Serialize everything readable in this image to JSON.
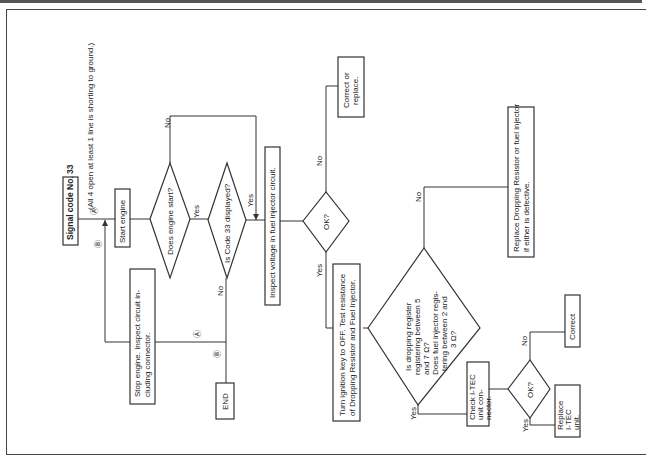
{
  "diagram": {
    "title": "Signal code No. 33",
    "subtitle": "(All 4 open at least 1 line is shorting to ground.)",
    "orientation": "rotated 90° counter-clockwise",
    "nodes": {
      "start_engine": "Start engine",
      "does_engine_start": "Does engine start?",
      "is_code_33": "Is Code 33 displayed?",
      "stop_engine_1": "Stop engine. Inspect circuit in-",
      "stop_engine_2": "cluding connector.",
      "end": "END",
      "inspect_voltage": "Inspect voltage in fuel injector circuit.",
      "ok1": "OK?",
      "correct_replace_1": "Correct or",
      "correct_replace_2": "replace.",
      "turn_ignition_1": "Turn ignition key to OFF. Test resistance",
      "turn_ignition_2": "of Dropping Resistor and Fuel Injector.",
      "dropping_q_1": "Is dropping register",
      "dropping_q_2": "registering between 5",
      "dropping_q_3": "and 7 Ω?",
      "dropping_q_4": "Does fuel injector regis-",
      "dropping_q_5": "tering between 2 and",
      "dropping_q_6": "3 Ω?",
      "replace_dropping_1": "Replace Dropping Resistor or fuel injector",
      "replace_dropping_2": "if either is defective.",
      "check_itec_1": "Check   I-TEC",
      "check_itec_2": "unit     con-",
      "check_itec_3": "nector.",
      "ok2": "OK?",
      "correct": "Correct",
      "replace_itec_1": "Replace",
      "replace_itec_2": "I-TEC",
      "replace_itec_3": "unit."
    },
    "labels": {
      "yes": "Yes",
      "no": "No",
      "marker_a": "Ⓐ",
      "marker_b": "Ⓑ"
    }
  }
}
